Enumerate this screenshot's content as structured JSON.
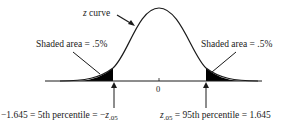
{
  "diagram": {
    "type": "standard normal curve with shaded tails",
    "curve_label_var": "z",
    "curve_label_text": " curve",
    "left_area_label": "Shaded area = .5%",
    "right_area_label": "Shaded area = .5%",
    "center_tick_label": "0",
    "left_bottom": {
      "prefix": "−1.645 = 5th percentile = −",
      "var": "z",
      "sub": ".05"
    },
    "right_bottom": {
      "var": "z",
      "sub": ".05",
      "suffix": " = 95th percentile = 1.645"
    },
    "colors": {
      "line": "#1a1a1a",
      "shade": "#000000",
      "background": "#ffffff"
    }
  }
}
